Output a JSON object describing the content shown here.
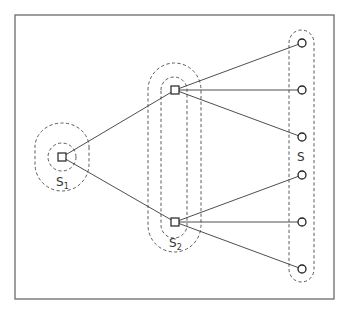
{
  "diagram": {
    "type": "layered-graph",
    "colors": {
      "frame": "#6b6b6b",
      "edge": "#3a3a3a",
      "dashed_region": "#4a4a4a",
      "node_stroke": "#222222",
      "background": "#ffffff"
    },
    "labels": {
      "s1": {
        "main": "S",
        "subscript": "1"
      },
      "s2": {
        "main": "S",
        "subscript": "2"
      },
      "s": {
        "main": "S"
      }
    },
    "nodes": {
      "squares": [
        {
          "id": "root",
          "shape": "square",
          "x": 62,
          "y": 157,
          "group": "S1"
        },
        {
          "id": "mid-top",
          "shape": "square",
          "x": 175,
          "y": 90,
          "group": "S2"
        },
        {
          "id": "mid-bottom",
          "shape": "square",
          "x": 175,
          "y": 222,
          "group": "S2"
        }
      ],
      "circles": [
        {
          "id": "leaf-1",
          "shape": "circle",
          "x": 302,
          "y": 43,
          "group": "S"
        },
        {
          "id": "leaf-2",
          "shape": "circle",
          "x": 302,
          "y": 90,
          "group": "S"
        },
        {
          "id": "leaf-3",
          "shape": "circle",
          "x": 302,
          "y": 137,
          "group": "S"
        },
        {
          "id": "leaf-4",
          "shape": "circle",
          "x": 302,
          "y": 175,
          "group": "S"
        },
        {
          "id": "leaf-5",
          "shape": "circle",
          "x": 302,
          "y": 222,
          "group": "S"
        },
        {
          "id": "leaf-6",
          "shape": "circle",
          "x": 302,
          "y": 269,
          "group": "S"
        }
      ]
    },
    "edges": [
      [
        "root",
        "mid-top"
      ],
      [
        "root",
        "mid-bottom"
      ],
      [
        "mid-top",
        "leaf-1"
      ],
      [
        "mid-top",
        "leaf-2"
      ],
      [
        "mid-top",
        "leaf-3"
      ],
      [
        "mid-bottom",
        "leaf-4"
      ],
      [
        "mid-bottom",
        "leaf-5"
      ],
      [
        "mid-bottom",
        "leaf-6"
      ]
    ],
    "regions": [
      {
        "id": "S1-inner",
        "style": "dashed",
        "encloses": [
          "root"
        ]
      },
      {
        "id": "S1-outer",
        "style": "dashed",
        "encloses": [
          "root"
        ]
      },
      {
        "id": "S2-inner",
        "style": "dashed",
        "encloses": [
          "mid-top",
          "mid-bottom"
        ]
      },
      {
        "id": "S2-outer",
        "style": "dashed",
        "encloses": [
          "mid-top",
          "mid-bottom"
        ]
      },
      {
        "id": "S",
        "style": "dashed",
        "encloses": [
          "leaf-1",
          "leaf-2",
          "leaf-3",
          "leaf-4",
          "leaf-5",
          "leaf-6"
        ]
      }
    ]
  }
}
